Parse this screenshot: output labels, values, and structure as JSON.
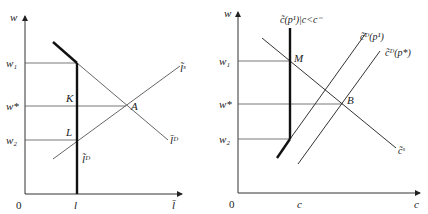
{
  "left_panel": {
    "y_axis_label": "w",
    "x_axis_label": "l̄",
    "origin_label": "0",
    "x_tick_label": "l",
    "y_ticks": {
      "w1": "w₁",
      "wstar": "w*",
      "w2": "w₂"
    },
    "points": {
      "K": "K",
      "A": "A",
      "L": "L"
    },
    "curves": {
      "supply": "l̃ˢ",
      "demand": "l̄ᴰ",
      "vertical": "l̃ᴰ"
    }
  },
  "right_panel": {
    "y_axis_label": "w",
    "x_axis_label": "c",
    "origin_label": "0",
    "x_tick_label": "c",
    "y_ticks": {
      "w1": "w₁",
      "wstar": "w*",
      "w2": "w₂"
    },
    "points": {
      "M": "M",
      "B": "B"
    },
    "curves": {
      "rationed": "c̃(p¹)|c<c⁻",
      "demand_p1": "c̃ᴰ(p¹)",
      "demand_pstar": "c̃ᴰ(p*)",
      "supply": "c̃ˢ"
    }
  },
  "colors": {
    "line": "#333333",
    "thick": "#111111",
    "text": "#222222"
  }
}
